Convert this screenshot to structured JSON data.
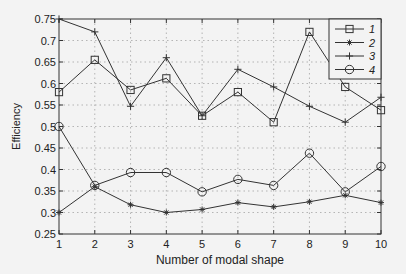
{
  "chart_data": {
    "type": "line",
    "title": "",
    "xlabel": "Number of modal shape",
    "ylabel": "Efficiency",
    "x": [
      1,
      2,
      3,
      4,
      5,
      6,
      7,
      8,
      9,
      10
    ],
    "xlim": [
      1,
      10
    ],
    "ylim": [
      0.25,
      0.75
    ],
    "yticks": [
      0.25,
      0.3,
      0.35,
      0.4,
      0.45,
      0.5,
      0.55,
      0.6,
      0.65,
      0.7,
      0.75
    ],
    "ytick_labels": [
      "0.25",
      "0.3",
      "0.35",
      "0.4",
      "0.45",
      "0.5",
      "0.55",
      "0.6",
      "0.65",
      "0.7",
      "0.75"
    ],
    "xtick_labels": [
      "1",
      "2",
      "3",
      "4",
      "5",
      "6",
      "7",
      "8",
      "9",
      "10"
    ],
    "grid": true,
    "legend_position": "upper right",
    "series": [
      {
        "name": "1",
        "marker": "square",
        "values": [
          0.58,
          0.655,
          0.585,
          0.612,
          0.525,
          0.58,
          0.51,
          0.72,
          0.592,
          0.538
        ]
      },
      {
        "name": "2",
        "marker": "star",
        "values": [
          0.3,
          0.36,
          0.318,
          0.3,
          0.307,
          0.323,
          0.313,
          0.325,
          0.34,
          0.323
        ]
      },
      {
        "name": "3",
        "marker": "plus",
        "values": [
          0.75,
          0.72,
          0.547,
          0.66,
          0.525,
          0.633,
          0.592,
          0.547,
          0.51,
          0.568
        ]
      },
      {
        "name": "4",
        "marker": "circle",
        "values": [
          0.5,
          0.363,
          0.393,
          0.393,
          0.348,
          0.377,
          0.363,
          0.438,
          0.348,
          0.407
        ]
      }
    ],
    "colors": {
      "line": "#333333",
      "axis": "#333333",
      "grid": "#999999",
      "background": "#f3f3f3"
    }
  }
}
